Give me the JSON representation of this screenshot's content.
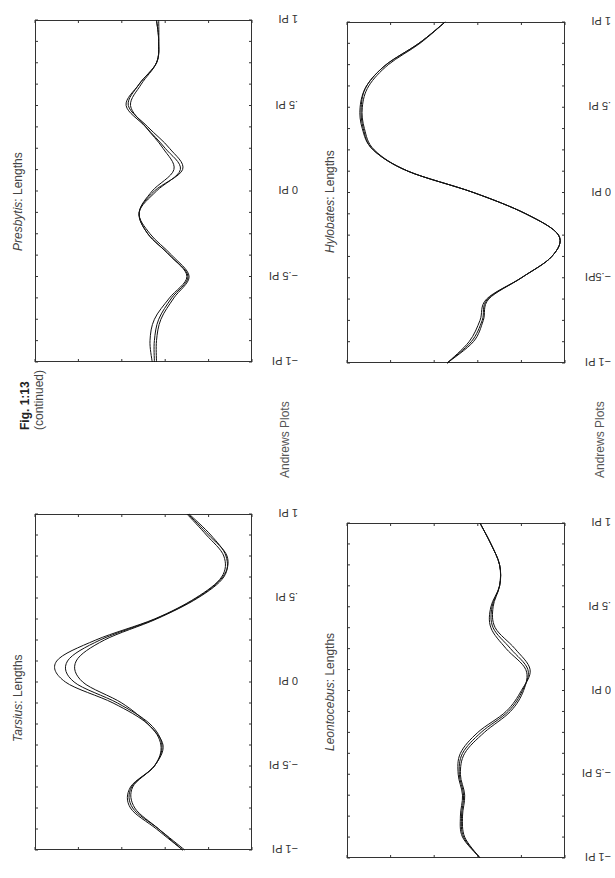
{
  "figure": {
    "label": "Fig. 1:13",
    "sublabel": "(continued)",
    "side_label_left": "Andrews Plots",
    "side_label_right": "Andrews Plots"
  },
  "theta_ticks": [
    "−1 PI",
    "−.5 PI",
    "0 PI",
    ".5 PI",
    "1 PI"
  ],
  "theta_ticks_hylobates": [
    "−1 PI",
    "−.5PI",
    "0 PI",
    ".5 PI",
    "1 PI"
  ],
  "panels": [
    {
      "id": "presbytis",
      "genus": "Presbytis",
      "suffix": ": Lengths",
      "box": {
        "left": 35,
        "top": 20,
        "right": 252,
        "bottom": 362
      }
    },
    {
      "id": "hylobates",
      "genus": "Hylobates",
      "suffix": ": Lengths",
      "box": {
        "left": 347,
        "top": 22,
        "right": 565,
        "bottom": 363
      }
    },
    {
      "id": "tarsius",
      "genus": "Tarsius",
      "suffix": ": Lengths",
      "box": {
        "left": 35,
        "top": 514,
        "right": 252,
        "bottom": 850
      }
    },
    {
      "id": "leontocebus",
      "genus": "Leontocebus",
      "suffix": ": Lengths",
      "box": {
        "left": 347,
        "top": 523,
        "right": 565,
        "bottom": 858
      }
    }
  ],
  "chart_data": [
    {
      "type": "line",
      "title": "Presbytis: Lengths",
      "xlabel": "theta (in PI units)",
      "ylabel": "f(t)",
      "x_ticks": [
        "−1 PI",
        "−.5 PI",
        "0 PI",
        ".5 PI",
        "1 PI"
      ],
      "x": [
        -1,
        -0.875,
        -0.75,
        -0.625,
        -0.5,
        -0.375,
        -0.25,
        -0.125,
        0,
        0.125,
        0.25,
        0.375,
        0.5,
        0.625,
        0.75,
        0.875,
        1
      ],
      "note": "values are horizontal positions as fraction of box width (0=left, 1=right); page rotated",
      "series": [
        {
          "name": "curve 1",
          "values": [
            0.54,
            0.53,
            0.55,
            0.62,
            0.7,
            0.62,
            0.52,
            0.48,
            0.55,
            0.68,
            0.62,
            0.52,
            0.43,
            0.48,
            0.56,
            0.57,
            0.56
          ]
        },
        {
          "name": "curve 2",
          "values": [
            0.56,
            0.56,
            0.58,
            0.64,
            0.71,
            0.63,
            0.53,
            0.48,
            0.56,
            0.67,
            0.6,
            0.51,
            0.42,
            0.48,
            0.56,
            0.57,
            0.57
          ]
        },
        {
          "name": "curve 3",
          "values": [
            0.55,
            0.55,
            0.57,
            0.63,
            0.705,
            0.62,
            0.52,
            0.48,
            0.54,
            0.64,
            0.59,
            0.51,
            0.44,
            0.49,
            0.56,
            0.57,
            0.56
          ]
        }
      ]
    },
    {
      "type": "line",
      "title": "Hylobates: Lengths",
      "xlabel": "theta (in PI units)",
      "ylabel": "f(t)",
      "x_ticks": [
        "−1 PI",
        "−.5PI",
        "0 PI",
        ".5 PI",
        "1 PI"
      ],
      "x": [
        -1,
        -0.875,
        -0.75,
        -0.625,
        -0.5,
        -0.375,
        -0.25,
        -0.125,
        0,
        0.125,
        0.25,
        0.375,
        0.5,
        0.625,
        0.75,
        0.875,
        1
      ],
      "note": "values are horizontal positions as fraction of box width (0=left, 1=right); page rotated",
      "series": [
        {
          "name": "curve 1",
          "values": [
            0.46,
            0.56,
            0.61,
            0.64,
            0.8,
            0.94,
            0.97,
            0.82,
            0.58,
            0.28,
            0.12,
            0.07,
            0.06,
            0.09,
            0.18,
            0.33,
            0.45
          ]
        },
        {
          "name": "curve 2",
          "values": [
            0.46,
            0.57,
            0.62,
            0.645,
            0.8,
            0.94,
            0.97,
            0.82,
            0.58,
            0.28,
            0.12,
            0.075,
            0.065,
            0.09,
            0.18,
            0.33,
            0.45
          ]
        },
        {
          "name": "curve 3",
          "values": [
            0.46,
            0.58,
            0.625,
            0.65,
            0.8,
            0.94,
            0.97,
            0.82,
            0.58,
            0.28,
            0.125,
            0.08,
            0.07,
            0.1,
            0.19,
            0.335,
            0.45
          ]
        }
      ]
    },
    {
      "type": "line",
      "title": "Tarsius: Lengths",
      "xlabel": "theta (in PI units)",
      "ylabel": "f(t)",
      "x_ticks": [
        "−1 PI",
        "−.5 PI",
        "0 PI",
        ".5 PI",
        "1 PI"
      ],
      "x": [
        -1,
        -0.875,
        -0.75,
        -0.625,
        -0.5,
        -0.375,
        -0.25,
        -0.125,
        0,
        0.125,
        0.25,
        0.375,
        0.5,
        0.625,
        0.75,
        0.875,
        1
      ],
      "note": "values are horizontal positions as fraction of box width (0=left, 1=right); page rotated",
      "series": [
        {
          "name": "curve 1",
          "values": [
            0.68,
            0.56,
            0.44,
            0.44,
            0.55,
            0.58,
            0.52,
            0.36,
            0.14,
            0.1,
            0.28,
            0.55,
            0.74,
            0.86,
            0.87,
            0.79,
            0.7
          ]
        },
        {
          "name": "curve 2",
          "values": [
            0.68,
            0.57,
            0.46,
            0.45,
            0.55,
            0.59,
            0.52,
            0.4,
            0.22,
            0.19,
            0.32,
            0.56,
            0.75,
            0.87,
            0.88,
            0.81,
            0.71
          ]
        },
        {
          "name": "curve 3",
          "values": [
            0.69,
            0.57,
            0.45,
            0.445,
            0.55,
            0.585,
            0.53,
            0.38,
            0.18,
            0.15,
            0.3,
            0.555,
            0.745,
            0.865,
            0.885,
            0.8,
            0.705
          ]
        }
      ]
    },
    {
      "type": "line",
      "title": "Leontocebus: Lengths",
      "xlabel": "theta (in PI units)",
      "ylabel": "f(t)",
      "x_ticks": [
        "−1 PI",
        "−.5 PI",
        "0 PI",
        ".5 PI",
        "1 PI"
      ],
      "x": [
        -1,
        -0.875,
        -0.75,
        -0.625,
        -0.5,
        -0.375,
        -0.25,
        -0.125,
        0,
        0.125,
        0.25,
        0.375,
        0.5,
        0.625,
        0.75,
        0.875,
        1
      ],
      "note": "values are horizontal positions as fraction of box width (0=left, 1=right); page rotated",
      "series": [
        {
          "name": "curve 1",
          "values": [
            0.61,
            0.53,
            0.52,
            0.53,
            0.51,
            0.52,
            0.6,
            0.73,
            0.8,
            0.84,
            0.77,
            0.68,
            0.67,
            0.7,
            0.7,
            0.66,
            0.61
          ]
        },
        {
          "name": "curve 2",
          "values": [
            0.61,
            0.54,
            0.53,
            0.54,
            0.52,
            0.54,
            0.63,
            0.75,
            0.81,
            0.82,
            0.73,
            0.66,
            0.66,
            0.7,
            0.7,
            0.66,
            0.61
          ]
        },
        {
          "name": "curve 3",
          "values": [
            0.61,
            0.535,
            0.525,
            0.535,
            0.515,
            0.53,
            0.615,
            0.74,
            0.805,
            0.83,
            0.75,
            0.67,
            0.665,
            0.7,
            0.7,
            0.66,
            0.61
          ]
        }
      ]
    }
  ]
}
